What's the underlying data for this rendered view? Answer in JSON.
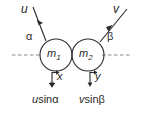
{
  "figure": {
    "type": "physics-collision-diagram",
    "background_color": "#ffffff",
    "stroke_color": "#2b2b2b",
    "axis": {
      "name": "horizontal-dashed-axis",
      "style": "dashed",
      "y": 55,
      "left_segment": {
        "x_start": 12,
        "x_end": 41
      },
      "right_segment": {
        "x_start": 103,
        "x_end": 131
      }
    },
    "masses": [
      {
        "id": "m1",
        "label": "m",
        "subscript": "1",
        "cx": 56,
        "cy": 55,
        "r": 16
      },
      {
        "id": "m2",
        "label": "m",
        "subscript": "2",
        "cx": 88,
        "cy": 55,
        "r": 16
      }
    ],
    "vectors": [
      {
        "id": "u-vector",
        "label": "u",
        "angle_label": "α",
        "direction": "down-right",
        "from": {
          "x": 33,
          "y": 8
        },
        "to": {
          "x": 46,
          "y": 41
        }
      },
      {
        "id": "v-vector",
        "label": "v",
        "angle_label": "β",
        "direction": "down-left",
        "from": {
          "x": 126,
          "y": 10
        },
        "to": {
          "x": 100,
          "y": 42
        }
      }
    ],
    "components": [
      {
        "id": "x-component",
        "axis_label": "x",
        "expression_var": "u",
        "expression_fn": "sin",
        "expression_angle": "α",
        "expression_full": "usinα",
        "arrow_x": 52,
        "arrow_y_start": 72,
        "arrow_y_end": 86
      },
      {
        "id": "y-component",
        "axis_label": "y",
        "expression_var": "v",
        "expression_fn": "sin",
        "expression_angle": "β",
        "expression_full": "vsinβ",
        "arrow_x": 90,
        "arrow_y_start": 72,
        "arrow_y_end": 86
      }
    ]
  }
}
